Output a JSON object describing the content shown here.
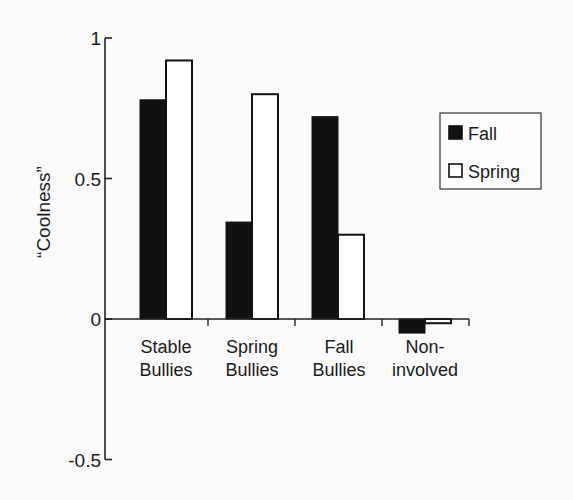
{
  "chart_data": {
    "type": "bar",
    "title": "",
    "xlabel": "",
    "ylabel": "“Coolness”",
    "ylim": [
      -0.5,
      1
    ],
    "yticks": [
      1,
      0.5,
      0,
      -0.5
    ],
    "ytick_labels": [
      "1",
      "0.5",
      "0",
      "-0.5"
    ],
    "categories": [
      "Stable Bullies",
      "Spring Bullies",
      "Fall Bullies",
      "Non-involved"
    ],
    "category_label_lines": [
      [
        "Stable",
        "Bullies"
      ],
      [
        "Spring",
        "Bullies"
      ],
      [
        "Fall",
        "Bullies"
      ],
      [
        "Non-",
        "involved"
      ]
    ],
    "series": [
      {
        "name": "Fall",
        "color": "#111111",
        "fill": "solid",
        "values": [
          0.78,
          0.345,
          0.72,
          -0.05
        ]
      },
      {
        "name": "Spring",
        "color": "#ffffff",
        "fill": "outline",
        "values": [
          0.92,
          0.8,
          0.3,
          -0.015
        ]
      }
    ],
    "grid": false,
    "legend": {
      "position": "upper-right",
      "entries": [
        "Fall",
        "Spring"
      ]
    }
  }
}
